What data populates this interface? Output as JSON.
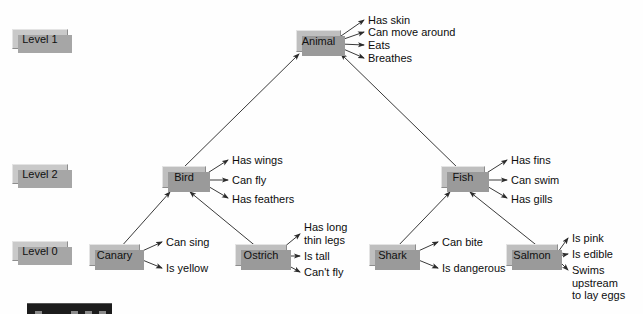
{
  "diagram": {
    "colors": {
      "node_fill": "#bfbfbf",
      "node_shadow": "#9a9a9a",
      "level_fill": "#c9c9c9",
      "line": "#3a3a3a",
      "text": "#0d0d0d",
      "background": "#fefefe"
    }
  },
  "levels": [
    {
      "id": "level-1",
      "label": "Level 1"
    },
    {
      "id": "level-2",
      "label": "Level 2"
    },
    {
      "id": "level-0",
      "label": "Level 0"
    }
  ],
  "nodes": [
    {
      "id": "animal",
      "label": "Animal",
      "level": "Level 1"
    },
    {
      "id": "bird",
      "label": "Bird",
      "level": "Level 2"
    },
    {
      "id": "fish",
      "label": "Fish",
      "level": "Level 2"
    },
    {
      "id": "canary",
      "label": "Canary",
      "level": "Level 0"
    },
    {
      "id": "ostrich",
      "label": "Ostrich",
      "level": "Level 0"
    },
    {
      "id": "shark",
      "label": "Shark",
      "level": "Level 0"
    },
    {
      "id": "salmon",
      "label": "Salmon",
      "level": "Level 0"
    }
  ],
  "properties": {
    "animal": [
      "Has skin",
      "Can move around",
      "Eats",
      "Breathes"
    ],
    "bird": [
      "Has wings",
      "Can fly",
      "Has feathers"
    ],
    "fish": [
      "Has fins",
      "Can swim",
      "Has gills"
    ],
    "canary": [
      "Can sing",
      "Is yellow"
    ],
    "ostrich": [
      "Has long\nthin legs",
      "Is tall",
      "Can't fly"
    ],
    "shark": [
      "Can bite",
      "Is dangerous"
    ],
    "salmon": [
      "Is pink",
      "Is edible",
      "Swims\nupstream\nto lay eggs"
    ]
  },
  "isa_links": [
    {
      "from": "Bird",
      "to": "Animal"
    },
    {
      "from": "Fish",
      "to": "Animal"
    },
    {
      "from": "Canary",
      "to": "Bird"
    },
    {
      "from": "Ostrich",
      "to": "Bird"
    },
    {
      "from": "Shark",
      "to": "Fish"
    },
    {
      "from": "Salmon",
      "to": "Fish"
    }
  ]
}
